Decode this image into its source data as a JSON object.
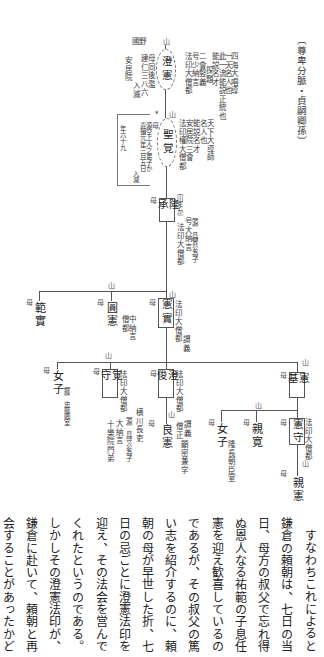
{
  "title": "〔尊卑分脈・貞嗣卿孫〕",
  "genealogy": {
    "choken": {
      "mark": "山",
      "name": "澄憲",
      "notes_right": [
        "四海大唱導",
        "一天名人也",
        "此一流能説正統也",
        "能説名才",
        "探題",
        "二會竪義",
        "号少納言",
        "法印大僧都"
      ],
      "place_label": "國野",
      "notes_left": [
        "母同後濫",
        "建仁三八六",
        "入滅",
        "安居院"
      ]
    },
    "shokaku": {
      "asterisk": "*",
      "mark": "山",
      "name": "聖覚",
      "notes_right": [
        "天下大導師",
        "名人也",
        "能説名才",
        "安居院三會",
        "法印權大僧都"
      ],
      "mother": "母",
      "notes_left": [
        "源空上人之弟子か",
        "嘉禎元年三月五日",
        "入滅",
        "年六十九"
      ]
    },
    "ryusho": {
      "mother": "母",
      "name": "隆承",
      "bracket_note": "〔山まか〕",
      "notes_right": [
        "〔源〕具實公為子",
        "号大納言",
        "法印大僧都"
      ]
    },
    "kenjitsu": {
      "mark": "山",
      "mother": "母",
      "name": "憲實",
      "notes_right": [
        "法印大僧都",
        "讃義"
      ]
    },
    "enken": {
      "mark": "山",
      "mother": "母",
      "name": "圓憲",
      "notes": [
        "中納言",
        "僧都"
      ]
    },
    "hanjitsu": {
      "mother": "母",
      "name": "範實"
    },
    "kenki": {
      "mark": "山",
      "mother": "母",
      "name": "憲基",
      "branch_mark": "山"
    },
    "kenshu": {
      "mother": "母",
      "name": "憲守",
      "notes_right": [
        "法印大僧都"
      ]
    },
    "shinken": {
      "mark": "山",
      "mother": "母",
      "name": "親憲"
    },
    "shinkan": {
      "mother": "母",
      "name": "親寛"
    },
    "daughter_1": {
      "mother": "母",
      "name": "女子",
      "notes": [
        "隆長朝臣室"
      ]
    },
    "chojun": {
      "mother": "母",
      "name": "澄俊",
      "notes_right": [
        "法印大僧都"
      ]
    },
    "ryoken": {
      "mark": "山",
      "mother": "母",
      "name": "良憲",
      "notes": [
        "讃義",
        "僧正",
        "顕密兼学"
      ]
    },
    "kakushu": {
      "mark": "山",
      "mother": "母",
      "name": "覚守",
      "notes_right": [
        "法印大僧都"
      ],
      "notes_left": [
        "横川長吏",
        "〔源〕具守公為子",
        "大納言",
        "十樂院門弟"
      ]
    },
    "daughter_2": {
      "mother": "母",
      "name": "女子",
      "notes": [
        "〔藤〕忠藤卿室"
      ]
    }
  },
  "body_text": {
    "columns": [
      "すなわちこれによると",
      "鎌倉の頼朝は、七日の当",
      "日、母方の叔父で忘れ得",
      "ぬ恩人なる祐範の子息任",
      "憲を迎え歓喜しているの",
      "であるが、その叔父の篤",
      "い志を紹介するのに、頼",
      "朝の母が早世した折、七",
      "日の忌ごとに澄憲法印を",
      "迎え、その法会を営んで",
      "くれたというのである。",
      "しかしその澄憲法印が、",
      "鎌倉に赴いて、頼朝と再",
      "会することがあったかど"
    ]
  }
}
